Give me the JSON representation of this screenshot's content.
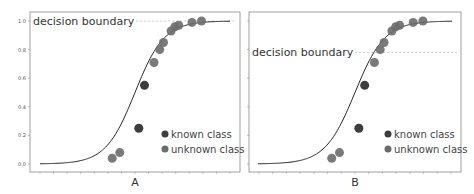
{
  "chart_data": [
    {
      "type": "scatter",
      "panel": "A",
      "xlabel": "A",
      "ylabel": "",
      "ylim": [
        0,
        1.0
      ],
      "yticks": [
        "0.0",
        "0.2",
        "0.4",
        "0.6",
        "0.8",
        "1.0"
      ],
      "grid": false,
      "curve": {
        "kind": "logistic",
        "midpoint": 0.5,
        "steepness": 13
      },
      "decision_boundary": {
        "label": "decision boundary",
        "y": 1.0
      },
      "points": {
        "known": [
          [
            0.55,
            0.55
          ],
          [
            0.52,
            0.25
          ]
        ],
        "unknown": [
          [
            0.38,
            0.04
          ],
          [
            0.42,
            0.08
          ],
          [
            0.6,
            0.71
          ],
          [
            0.63,
            0.8
          ],
          [
            0.65,
            0.85
          ],
          [
            0.69,
            0.93
          ],
          [
            0.71,
            0.96
          ],
          [
            0.73,
            0.97
          ],
          [
            0.8,
            0.99
          ],
          [
            0.85,
            1.0
          ]
        ]
      },
      "series": [
        {
          "name": "known class",
          "color": "#3d3d3d"
        },
        {
          "name": "unknown class",
          "color": "#6b6b6b"
        }
      ],
      "legend": "bottom-right"
    },
    {
      "type": "scatter",
      "panel": "B",
      "xlabel": "B",
      "ylabel": "",
      "ylim": [
        0,
        1.0
      ],
      "yticks": [
        "0.0",
        "0.2",
        "0.4",
        "0.6",
        "0.8",
        "1.0"
      ],
      "grid": false,
      "curve": {
        "kind": "logistic",
        "midpoint": 0.5,
        "steepness": 13
      },
      "decision_boundary": {
        "label": "decision boundary",
        "y": 0.78
      },
      "points": {
        "known": [
          [
            0.55,
            0.55
          ],
          [
            0.52,
            0.25
          ]
        ],
        "unknown": [
          [
            0.38,
            0.04
          ],
          [
            0.42,
            0.08
          ],
          [
            0.6,
            0.71
          ],
          [
            0.63,
            0.8
          ],
          [
            0.65,
            0.85
          ],
          [
            0.69,
            0.93
          ],
          [
            0.71,
            0.96
          ],
          [
            0.73,
            0.97
          ],
          [
            0.8,
            0.99
          ],
          [
            0.85,
            1.0
          ]
        ]
      },
      "series": [
        {
          "name": "known class",
          "color": "#3d3d3d"
        },
        {
          "name": "unknown class",
          "color": "#6b6b6b"
        }
      ],
      "legend": "bottom-right"
    }
  ]
}
